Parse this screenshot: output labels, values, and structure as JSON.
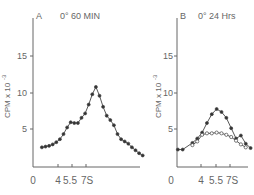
{
  "chart_data": [
    {
      "type": "line",
      "panel": "A",
      "title": "0° 60 MIN",
      "xlabel": "",
      "ylabel": "CPM x 10^-3",
      "ylim": [
        0,
        19
      ],
      "yticks": [
        5,
        10,
        15
      ],
      "xticks": [
        "0",
        "4",
        "5.5",
        "7S"
      ],
      "grid": false,
      "series": [
        {
          "name": "filled",
          "marker": "filled-circle",
          "x": [
            1.5,
            2.5,
            3.5,
            4.5,
            5.5,
            6.5,
            7.5,
            8.5,
            9.5,
            10.5,
            11.5,
            12.5,
            13.5,
            14.5,
            15.5,
            16.5,
            17.5,
            18.5,
            19.5,
            20.5,
            21.5,
            22.5,
            23.5,
            24.5,
            25.5,
            26.5,
            27.5,
            28.5,
            29.5
          ],
          "values": [
            2.6,
            2.7,
            2.8,
            3.0,
            3.3,
            3.7,
            4.4,
            5.3,
            6.0,
            5.9,
            5.9,
            6.6,
            7.2,
            8.4,
            9.8,
            10.8,
            9.6,
            8.1,
            6.9,
            6.3,
            5.6,
            4.4,
            3.7,
            3.4,
            3.1,
            2.6,
            2.2,
            1.8,
            1.5
          ]
        }
      ]
    },
    {
      "type": "line",
      "panel": "B",
      "title": "0° 24 Hrs",
      "xlabel": "",
      "ylabel": "CPM x 10^-3",
      "ylim": [
        0,
        19
      ],
      "yticks": [
        5,
        10,
        15
      ],
      "xticks": [
        "0",
        "4",
        "5.5",
        "7S"
      ],
      "grid": false,
      "series": [
        {
          "name": "filled",
          "marker": "filled-circle",
          "x": [
            1,
            2,
            4,
            5,
            6,
            7,
            8,
            9,
            10,
            11,
            12,
            13,
            14,
            15,
            16
          ],
          "values": [
            2.3,
            2.3,
            3.2,
            3.8,
            4.6,
            5.9,
            7.1,
            7.8,
            7.4,
            6.6,
            5.2,
            3.8,
            4.2,
            3.1,
            2.5
          ]
        },
        {
          "name": "open",
          "marker": "open-circle",
          "x": [
            4,
            5,
            6,
            7,
            8,
            9,
            10,
            11,
            12,
            13,
            14,
            15
          ],
          "values": [
            2.9,
            3.4,
            4.3,
            4.5,
            4.5,
            4.6,
            4.5,
            4.3,
            4.0,
            3.5,
            3.0,
            2.6
          ]
        }
      ]
    }
  ],
  "panels": {
    "a": {
      "letter": "A",
      "title": "0° 60 MIN",
      "ylabel": "CPM x 10",
      "yexp": "-3",
      "yticks": [
        "15",
        "10",
        "5"
      ],
      "xticks": [
        "0",
        "4",
        "5.5",
        "7S"
      ]
    },
    "b": {
      "letter": "B",
      "title": "0° 24 Hrs",
      "ylabel": "CPM x 10",
      "yexp": "-3",
      "yticks": [
        "15",
        "10",
        "5"
      ],
      "xticks": [
        "0",
        "4",
        "5.5",
        "7S"
      ]
    }
  }
}
